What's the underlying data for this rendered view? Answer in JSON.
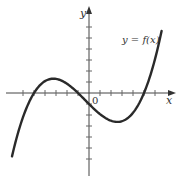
{
  "chart_data": {
    "type": "line",
    "title": "",
    "xlabel": "x",
    "ylabel": "y",
    "origin_label": "0",
    "series": [
      {
        "name": "y = f(x)",
        "description": "cubic with roots near x = -5, -1, 5; local max ≈ (-3.1, 1.3); local min ≈ (2.7, -2.6)",
        "x": [
          -7,
          -6,
          -5,
          -4,
          -3,
          -2,
          -1,
          0,
          1,
          2,
          3,
          4,
          5,
          6,
          6.6
        ],
        "y": [
          -5.76,
          -2.2,
          0,
          0.9,
          1.28,
          1.26,
          0,
          -1.0,
          -1.92,
          -2.52,
          -2.56,
          -1.8,
          0,
          3.08,
          5.6
        ]
      }
    ],
    "xlim": [
      -7.5,
      7.7
    ],
    "ylim": [
      -7.3,
      8.4
    ],
    "grid": false,
    "tick_spacing": 1,
    "x_ticks_tick_marks_only": true,
    "y_ticks_tick_marks_only": true,
    "annotations": [
      {
        "text": "y = f(x)",
        "x": 4.2,
        "y": 4.8
      }
    ],
    "legend": "none"
  }
}
